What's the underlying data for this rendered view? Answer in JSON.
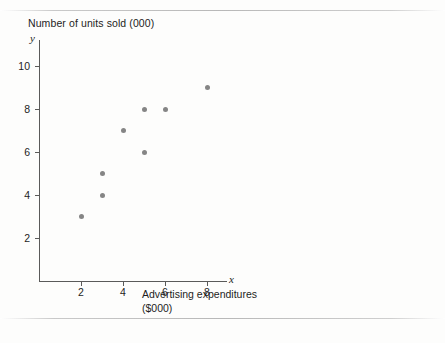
{
  "chart_data": {
    "type": "scatter",
    "title": "Number of units sold (000)",
    "xlabel": "Advertising expenditures\n($000)",
    "xlabel_line1": "Advertising expenditures",
    "xlabel_line2": "($000)",
    "ylabel": "Number of units sold (000)",
    "x_axis_symbol": "x",
    "y_axis_symbol": "y",
    "xlim": [
      0,
      9
    ],
    "ylim": [
      0,
      11.2
    ],
    "xticks": [
      2,
      4,
      6,
      8
    ],
    "yticks": [
      2,
      4,
      6,
      8,
      10
    ],
    "xtick_labels": [
      "2",
      "4",
      "6",
      "8"
    ],
    "ytick_labels": [
      "2",
      "4",
      "6",
      "8",
      "10"
    ],
    "grid": false,
    "legend": false,
    "marker_color": "#858585",
    "axis_color": "#5a5a5a",
    "x": [
      2,
      3,
      3,
      4,
      5,
      5,
      6,
      8
    ],
    "y": [
      3,
      4,
      5,
      7,
      6,
      8,
      8,
      9
    ],
    "points": [
      {
        "x": 2,
        "y": 3
      },
      {
        "x": 3,
        "y": 4
      },
      {
        "x": 3,
        "y": 5
      },
      {
        "x": 4,
        "y": 7
      },
      {
        "x": 5,
        "y": 6
      },
      {
        "x": 5,
        "y": 8
      },
      {
        "x": 6,
        "y": 8
      },
      {
        "x": 8,
        "y": 9
      }
    ]
  },
  "page": {
    "background": "#fdfdfc",
    "rule_color": "#b8b8b8"
  }
}
